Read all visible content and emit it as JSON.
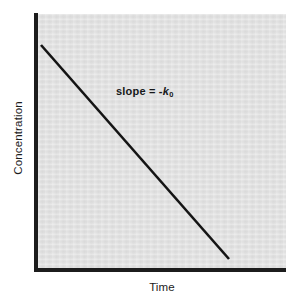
{
  "figure": {
    "name": "zero-order-kinetics-plot",
    "background_color": "#ffffff",
    "panel_color": "#e2e2e2",
    "axis_color": "#1c1c1c",
    "line_color": "#141414"
  },
  "chart_data": {
    "type": "line",
    "title": "",
    "subtitle": "",
    "xlabel": "Time",
    "ylabel": "Concentration",
    "xlim": [
      0,
      1
    ],
    "ylim": [
      0,
      1
    ],
    "xticklabels": [],
    "yticklabels": [],
    "grid": false,
    "legend": null,
    "series": [
      {
        "name": "concentration-vs-time",
        "x": [
          0.0,
          1.0
        ],
        "y": [
          1.0,
          0.0
        ],
        "style": "solid",
        "color": "#141414",
        "width_px": 2.6
      }
    ],
    "annotations": [
      {
        "name": "slope-annotation",
        "text_prefix": "slope = -",
        "symbol": "k",
        "subscript": "0",
        "x": 0.33,
        "y": 0.72
      }
    ]
  },
  "axes": {
    "y_label": "Concentration",
    "x_label": "Time"
  },
  "annotation": {
    "prefix": "slope = -",
    "symbol": "k",
    "subscript": "0"
  }
}
